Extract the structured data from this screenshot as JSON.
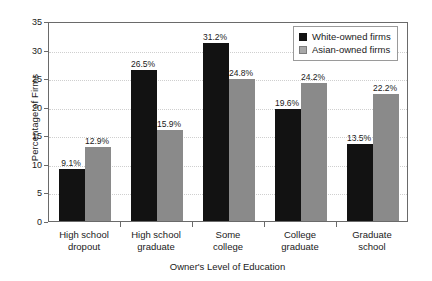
{
  "chart_data": {
    "type": "bar",
    "title": "",
    "xlabel": "Owner's Level of Education",
    "ylabel": "Percentage of Firms",
    "ylim": [
      0,
      35
    ],
    "yticks": [
      0,
      5,
      10,
      15,
      20,
      25,
      30,
      35
    ],
    "grid": true,
    "legend_position": "top-right",
    "categories": [
      "High school dropout",
      "High school graduate",
      "Some college",
      "College graduate",
      "Graduate school"
    ],
    "category_lines": [
      [
        "High school",
        "dropout"
      ],
      [
        "High school",
        "graduate"
      ],
      [
        "Some",
        "college"
      ],
      [
        "College",
        "graduate"
      ],
      [
        "Graduate",
        "school"
      ]
    ],
    "series": [
      {
        "name": "White-owned firms",
        "color": "#121212",
        "values": [
          9.1,
          26.5,
          31.2,
          19.6,
          13.5
        ],
        "labels": [
          "9.1%",
          "26.5%",
          "31.2%",
          "19.6%",
          "13.5%"
        ]
      },
      {
        "name": "Asian-owned firms",
        "color": "#8a8a8a",
        "values": [
          12.9,
          15.9,
          24.8,
          24.2,
          22.2
        ],
        "labels": [
          "12.9%",
          "15.9%",
          "24.8%",
          "24.2%",
          "22.2%"
        ]
      }
    ]
  }
}
